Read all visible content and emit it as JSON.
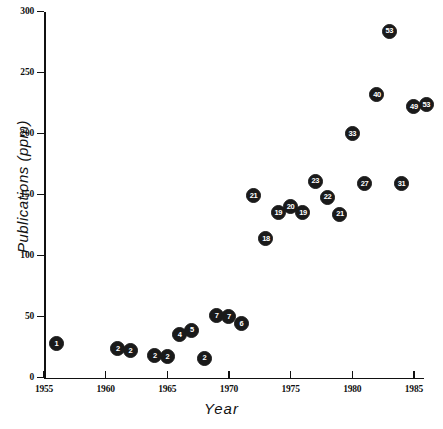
{
  "chart_data": {
    "type": "scatter",
    "title": "",
    "xlabel": "Year",
    "ylabel": "Publications  (ppm)",
    "xlim": [
      1955,
      1986
    ],
    "ylim": [
      0,
      300
    ],
    "xticks": [
      1955,
      1960,
      1965,
      1970,
      1975,
      1980,
      1985
    ],
    "yticks": [
      0,
      50,
      100,
      150,
      200,
      250,
      300
    ],
    "grid": false,
    "legend": "none",
    "marker_style": "filled-circle-with-number-label",
    "points": [
      {
        "label": "1",
        "x": 1956,
        "y": 28
      },
      {
        "label": "2",
        "x": 1961,
        "y": 24
      },
      {
        "label": "2",
        "x": 1962,
        "y": 22
      },
      {
        "label": "2",
        "x": 1964,
        "y": 18
      },
      {
        "label": "2",
        "x": 1965,
        "y": 17
      },
      {
        "label": "4",
        "x": 1966,
        "y": 35
      },
      {
        "label": "5",
        "x": 1967,
        "y": 39
      },
      {
        "label": "2",
        "x": 1968,
        "y": 16
      },
      {
        "label": "7",
        "x": 1969,
        "y": 51
      },
      {
        "label": "7",
        "x": 1970,
        "y": 50
      },
      {
        "label": "6",
        "x": 1971,
        "y": 44
      },
      {
        "label": "21",
        "x": 1972,
        "y": 149
      },
      {
        "label": "18",
        "x": 1973,
        "y": 114
      },
      {
        "label": "19",
        "x": 1974,
        "y": 135
      },
      {
        "label": "20",
        "x": 1975,
        "y": 140
      },
      {
        "label": "19",
        "x": 1976,
        "y": 135
      },
      {
        "label": "23",
        "x": 1977,
        "y": 161
      },
      {
        "label": "22",
        "x": 1978,
        "y": 148
      },
      {
        "label": "21",
        "x": 1979,
        "y": 134
      },
      {
        "label": "33",
        "x": 1980,
        "y": 200
      },
      {
        "label": "27",
        "x": 1981,
        "y": 159
      },
      {
        "label": "40",
        "x": 1982,
        "y": 232
      },
      {
        "label": "53",
        "x": 1983,
        "y": 284
      },
      {
        "label": "31",
        "x": 1984,
        "y": 159
      },
      {
        "label": "49",
        "x": 1985,
        "y": 222
      },
      {
        "label": "53",
        "x": 1986,
        "y": 224
      }
    ]
  }
}
